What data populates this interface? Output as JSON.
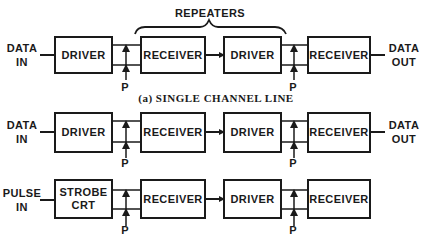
{
  "diagram": {
    "title_bracket": "REPEATERS",
    "caption": "(a) SINGLE CHANNEL LINE",
    "rows": [
      {
        "input": [
          "DATA",
          "IN"
        ],
        "output": [
          "DATA",
          "OUT"
        ],
        "blocks": [
          "DRIVER",
          "RECEIVER",
          "DRIVER",
          "RECEIVER"
        ],
        "p_labels": [
          "P",
          "P"
        ]
      },
      {
        "input": [
          "DATA",
          "IN"
        ],
        "output": [
          "DATA",
          "OUT"
        ],
        "blocks": [
          "DRIVER",
          "RECEIVER",
          "DRIVER",
          "RECEIVER"
        ],
        "p_labels": [
          "P",
          "P"
        ]
      },
      {
        "input": [
          "PULSE",
          "IN"
        ],
        "output": [],
        "blocks": [
          [
            "STROBE",
            "CRT"
          ],
          "RECEIVER",
          "DRIVER",
          "RECEIVER"
        ],
        "p_labels": [
          "P",
          "P"
        ]
      }
    ]
  }
}
